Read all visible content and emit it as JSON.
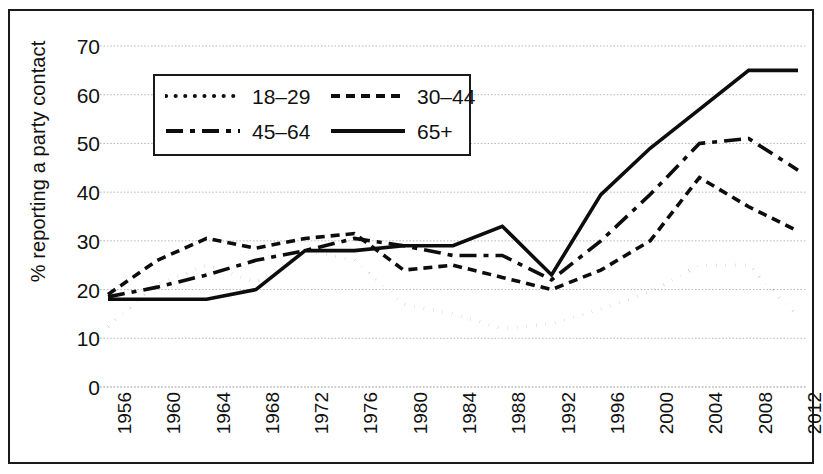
{
  "figure": {
    "type": "line-chart",
    "ylabel": "% reporting a party contact"
  },
  "legend": {
    "entries": [
      {
        "label": "18–29",
        "style": "dotted"
      },
      {
        "label": "30–44",
        "style": "dashed"
      },
      {
        "label": "45–64",
        "style": "dash-dot"
      },
      {
        "label": "65+",
        "style": "solid"
      }
    ]
  },
  "axes": {
    "yticks": [
      "0",
      "10",
      "20",
      "30",
      "40",
      "50",
      "60",
      "70"
    ],
    "xticks": [
      "1956",
      "1960",
      "1964",
      "1968",
      "1972",
      "1976",
      "1980",
      "1984",
      "1988",
      "1992",
      "1996",
      "2000",
      "2004",
      "2008",
      "2012"
    ]
  },
  "chart_data": {
    "type": "line",
    "title": "",
    "xlabel": "",
    "ylabel": "% reporting a party contact",
    "x": [
      1956,
      1960,
      1964,
      1968,
      1972,
      1976,
      1980,
      1984,
      1988,
      1992,
      1996,
      2000,
      2004,
      2008,
      2012
    ],
    "categories": [
      "1956",
      "1960",
      "1964",
      "1968",
      "1972",
      "1976",
      "1980",
      "1984",
      "1988",
      "1992",
      "1996",
      "2000",
      "2004",
      "2008",
      "2012"
    ],
    "ylim": [
      0,
      70
    ],
    "xlim": [
      1956,
      2012
    ],
    "grid": true,
    "legend_position": "upper-left-inside",
    "series": [
      {
        "name": "18–29",
        "style": "dotted",
        "color": "#0d0d0d",
        "values": [
          12.5,
          21,
          25,
          21.5,
          28,
          26,
          17,
          15,
          12,
          13,
          16,
          19.5,
          25,
          25,
          14.5
        ]
      },
      {
        "name": "30–44",
        "style": "dashed",
        "color": "#0d0d0d",
        "values": [
          19,
          26,
          30.5,
          28.5,
          30.5,
          31.5,
          24,
          25,
          22.5,
          20,
          24,
          30,
          43,
          37,
          32
        ]
      },
      {
        "name": "45–64",
        "style": "dash-dot",
        "color": "#0d0d0d",
        "values": [
          18.5,
          20.5,
          23,
          26,
          28,
          30.5,
          29,
          27,
          27,
          22,
          30,
          39.5,
          50,
          51,
          44.5
        ]
      },
      {
        "name": "65+",
        "style": "solid",
        "color": "#0d0d0d",
        "values": [
          18,
          18,
          18,
          20,
          28,
          28,
          29,
          29,
          33,
          23,
          39.5,
          49,
          57,
          65,
          65
        ]
      }
    ]
  }
}
